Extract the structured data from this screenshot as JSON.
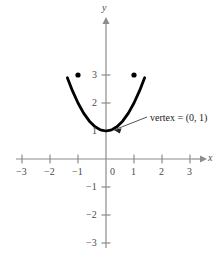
{
  "chart_data": {
    "type": "line",
    "title": "",
    "xlabel": "x",
    "ylabel": "y",
    "equation": "y = x^2 + 1",
    "xlim": [
      -3.6,
      3.6
    ],
    "ylim": [
      -3.6,
      3.9
    ],
    "grid": false,
    "legend": null,
    "x_ticks": [
      -3,
      -2,
      -1,
      0,
      1,
      2,
      3
    ],
    "x_tick_labels": [
      "−3",
      "−2",
      "−1",
      "0",
      "1",
      "2",
      "3"
    ],
    "y_ticks": [
      -3,
      -2,
      -1,
      1,
      2,
      3
    ],
    "y_tick_labels": [
      "−3",
      "−2",
      "−1",
      "1",
      "2",
      "3"
    ],
    "series": [
      {
        "name": "parabola",
        "color": "#000000",
        "x": [
          -1.38,
          -1.2,
          -1.0,
          -0.8,
          -0.6,
          -0.4,
          -0.2,
          0.0,
          0.2,
          0.4,
          0.6,
          0.8,
          1.0,
          1.2,
          1.38
        ],
        "y": [
          2.9,
          2.44,
          2.0,
          1.64,
          1.36,
          1.16,
          1.04,
          1.0,
          1.04,
          1.16,
          1.36,
          1.64,
          2.0,
          2.44,
          2.9
        ]
      }
    ],
    "points": [
      {
        "name": "left-marker",
        "x": -1,
        "y": 3
      },
      {
        "name": "right-marker",
        "x": 1,
        "y": 3
      },
      {
        "name": "vertex",
        "x": 0,
        "y": 1
      }
    ],
    "annotations": [
      {
        "name": "vertex-callout",
        "text": "vertex = (0, 1)",
        "target_x": 0,
        "target_y": 1
      }
    ],
    "colors": {
      "curve": "#000000",
      "axis": "#8c8c8c",
      "tick_label": "#4a4a4a",
      "annotation": "#1a1a1a",
      "background": "#ffffff"
    }
  },
  "axes": {
    "x_name": "x",
    "y_name": "y"
  },
  "ticks": {
    "x": [
      {
        "label": "−3"
      },
      {
        "label": "−2"
      },
      {
        "label": "−1"
      },
      {
        "label": "0"
      },
      {
        "label": "1"
      },
      {
        "label": "2"
      },
      {
        "label": "3"
      }
    ],
    "y": [
      {
        "label": "3"
      },
      {
        "label": "2"
      },
      {
        "label": "1"
      },
      {
        "label": "−1"
      },
      {
        "label": "−2"
      },
      {
        "label": "−3"
      }
    ]
  },
  "annotation": {
    "vertex_label": "vertex = (0, 1)"
  }
}
